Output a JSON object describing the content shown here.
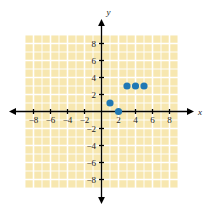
{
  "figure": {
    "type": "coordinate-plane-scatter",
    "width": 206,
    "height": 210,
    "background_color": "#ffffff",
    "grid_fill_color": "#f7e7b0",
    "grid_line_color": "#ffffff",
    "axis_color": "#000000",
    "point_color": "#1f78b4",
    "x_axis_label": "x",
    "y_axis_label": "y"
  },
  "chart_data": {
    "type": "scatter",
    "title": "",
    "subtitle": "",
    "xlabel": "x",
    "ylabel": "y",
    "xlim": [
      -9,
      9
    ],
    "ylim": [
      -9,
      9
    ],
    "grid": true,
    "legend": null,
    "legend_position": "none",
    "x_ticks": [
      -8,
      -6,
      -4,
      -2,
      2,
      4,
      6,
      8
    ],
    "y_ticks": [
      -8,
      -6,
      -4,
      -2,
      2,
      4,
      6,
      8
    ],
    "x_tick_labels": [
      "−8",
      "−6",
      "−4",
      "−2",
      "2",
      "4",
      "6",
      "8"
    ],
    "y_tick_labels": [
      "−8",
      "−6",
      "−4",
      "−2",
      "2",
      "4",
      "6",
      "8"
    ],
    "minor_grid_step": 1,
    "major_grid_step": 2,
    "grid_extent": {
      "x_min": -9,
      "x_max": 9,
      "y_min": -9,
      "y_max": 9
    },
    "series": [
      {
        "name": "points",
        "color": "#1f78b4",
        "marker": "circle",
        "marker_size": 6,
        "points": [
          {
            "x": 1,
            "y": 1
          },
          {
            "x": 2,
            "y": 0
          },
          {
            "x": 3,
            "y": 3
          },
          {
            "x": 4,
            "y": 3
          },
          {
            "x": 5,
            "y": 3
          }
        ]
      }
    ],
    "x": [
      1,
      2,
      3,
      4,
      5
    ],
    "values": [
      1,
      0,
      3,
      3,
      3
    ],
    "annotations": []
  }
}
